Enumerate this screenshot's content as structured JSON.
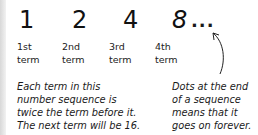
{
  "terms": [
    {
      "value": "1",
      "label_line1": "1st",
      "label_line2": "term"
    },
    {
      "value": "2",
      "label_line1": "2nd",
      "label_line2": "term"
    },
    {
      "value": "4",
      "label_line1": "3rd",
      "label_line2": "term"
    },
    {
      "value": "8",
      "label_line1": "4th",
      "label_line2": "term"
    }
  ],
  "ellipsis": "...",
  "left_note": [
    "Each term in this",
    "number sequence is",
    "twice the term before it.",
    "The next term will be 16."
  ],
  "right_note": [
    "Dots at the end",
    "of a sequence",
    "means that it",
    "goes on forever."
  ]
}
